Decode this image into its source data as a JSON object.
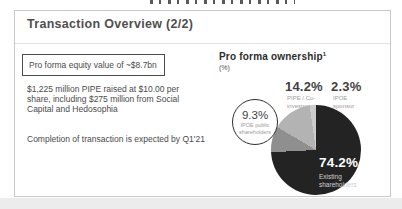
{
  "slide": {
    "title": "Transaction Overview (2/2)"
  },
  "left_panel": {
    "equity_box": "Pro forma equity value of ~$8.7bn",
    "para_pipe": "$1,225 million PIPE raised at $10.00 per share, including $275 million from Social Capital and Hedosophia",
    "para_completion": "Completion of transaction is expected by Q1'21"
  },
  "ownership_chart": {
    "title": "Pro forma ownership",
    "footnote_marker": "1",
    "unit_label": "(%)",
    "labels": {
      "pipe": {
        "pct": "14.2%",
        "name": "PIPE / Co-\ninvestment"
      },
      "sponsor": {
        "pct": "2.3%",
        "name": "IPOE\nsponsor"
      },
      "public": {
        "pct": "9.3%",
        "name": "IPOE public\nshareholders"
      },
      "existing": {
        "pct": "74.2%",
        "name": "Existing\nshareholders"
      }
    }
  },
  "chart_data": {
    "type": "pie",
    "title": "Pro forma ownership",
    "unit": "%",
    "slices": [
      {
        "label": "Existing shareholders",
        "value": 74.2,
        "color": "#232323"
      },
      {
        "label": "IPOE public shareholders",
        "value": 9.3,
        "color": "#8f8f8f"
      },
      {
        "label": "PIPE / Co-investment",
        "value": 14.2,
        "color": "#b3b3b3"
      },
      {
        "label": "IPOE sponsor",
        "value": 2.3,
        "color": "#cbcbcb"
      }
    ],
    "start_angle_deg": 0,
    "direction": "clockwise",
    "legend_position": "labels-around-pie"
  },
  "colors": {
    "card_border": "#c9c9c9",
    "divider": "#e3e3e3",
    "text_dark": "#4a4a4a",
    "text_muted": "#9b9b9b",
    "page_strip": "#ececec",
    "pie_label_white": "#ffffff"
  }
}
